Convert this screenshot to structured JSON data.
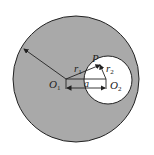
{
  "diagram": {
    "type": "geometry",
    "colors": {
      "fill": "#a9a9a9",
      "cavity": "#ffffff",
      "stroke": "#222222"
    },
    "big_circle": {
      "cx": 76,
      "cy": 79,
      "r": 63
    },
    "small_circle": {
      "cx": 108,
      "cy": 80,
      "r": 24
    },
    "points": {
      "O1": {
        "x": 66,
        "y": 79
      },
      "O2": {
        "x": 106,
        "y": 79
      },
      "P": {
        "x": 100,
        "y": 65
      }
    },
    "labels": {
      "O1": {
        "main": "O",
        "sub": "1"
      },
      "O2": {
        "main": "O",
        "sub": "2"
      },
      "P": "P",
      "r1": {
        "main": "r",
        "sub": "1"
      },
      "r2": {
        "main": "r",
        "sub": "2"
      },
      "a": "a"
    }
  }
}
